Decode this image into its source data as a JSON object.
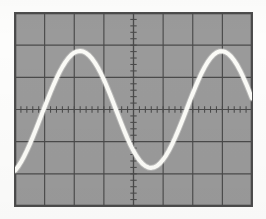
{
  "figure": {
    "kind": "oscilloscope-screen",
    "caption": "",
    "page_background": "#fdfdfc"
  },
  "screen": {
    "label": "CRT display",
    "background_color": "#9a9a9a",
    "border_color": "#4d4d4d",
    "graticule_color": "#4a4a4a",
    "trace_color": "#fbfbf7",
    "left": 14,
    "top": 12,
    "width": 239,
    "height": 195
  },
  "graticule": {
    "label": "graticule",
    "horizontal_divisions": 8,
    "vertical_divisions": 6,
    "division_width_px": 29.6,
    "division_height_px": 32.2,
    "minor_ticks_per_division": 5,
    "center_x_px": 133.5,
    "center_y_px": 109.5,
    "has_center_axis_ticks": true
  },
  "chart_data": {
    "type": "line",
    "title": "",
    "subtitle": "",
    "xlabel": "",
    "ylabel": "",
    "legend": [],
    "grid": true,
    "waveform": "sine",
    "amplitude_divisions": 2.0,
    "period_divisions": 4.0,
    "cycles_visible": 2.0,
    "phase_at_left_edge_deg": 200,
    "vertical_offset_divisions": 0,
    "xlim_divisions": [
      -4,
      4
    ],
    "ylim_divisions": [
      -3,
      3
    ],
    "peaks_divisions_x": [
      -2.4,
      1.6
    ],
    "troughs_divisions_x": [
      -0.4,
      3.6
    ],
    "x": [
      -4.0,
      -3.9,
      -3.8,
      -3.7,
      -3.6,
      -3.5,
      -3.4,
      -3.3,
      -3.2,
      -3.1,
      -3.0,
      -2.9,
      -2.8,
      -2.7,
      -2.6,
      -2.5,
      -2.4,
      -2.3,
      -2.2,
      -2.1,
      -2.0,
      -1.9,
      -1.8,
      -1.7,
      -1.6,
      -1.5,
      -1.4,
      -1.3,
      -1.2,
      -1.1,
      -1.0,
      -0.9,
      -0.8,
      -0.7,
      -0.6,
      -0.5,
      -0.4,
      -0.3,
      -0.2,
      -0.1,
      0.0,
      0.1,
      0.2,
      0.3,
      0.4,
      0.5,
      0.6,
      0.7,
      0.8,
      0.9,
      1.0,
      1.1,
      1.2,
      1.3,
      1.4,
      1.5,
      1.6,
      1.7,
      1.8,
      1.9,
      2.0,
      2.1,
      2.2,
      2.3,
      2.4,
      2.5,
      2.6,
      2.7,
      2.8,
      2.9,
      3.0,
      3.1,
      3.2,
      3.3,
      3.4,
      3.5,
      3.6,
      3.7,
      3.8,
      3.9,
      4.0
    ],
    "y": [
      -1.902,
      -1.782,
      -1.637,
      -1.469,
      -1.281,
      -1.076,
      -0.858,
      -0.63,
      -0.396,
      -0.159,
      0.079,
      0.313,
      0.541,
      0.76,
      0.966,
      1.155,
      1.325,
      1.473,
      1.597,
      1.695,
      1.765,
      1.806,
      1.819,
      1.802,
      1.756,
      1.681,
      1.579,
      1.45,
      1.297,
      1.122,
      0.927,
      0.716,
      0.492,
      0.258,
      0.019,
      -0.222,
      -0.459,
      -0.688,
      -0.905,
      -1.106,
      -1.287,
      -1.445,
      -1.577,
      -1.682,
      -1.757,
      -1.801,
      -1.814,
      -1.796,
      -1.747,
      -1.668,
      -1.56,
      -1.425,
      -1.266,
      -1.085,
      -0.886,
      -0.672,
      -0.447,
      -0.214,
      0.023,
      0.261,
      0.495,
      0.722,
      0.937,
      1.136,
      1.315,
      1.47,
      1.599,
      1.699,
      1.769,
      1.807,
      1.813,
      1.787,
      1.729,
      1.64,
      1.522,
      1.377,
      1.207,
      1.015,
      0.806,
      0.582,
      0.348
    ]
  },
  "a11y": {
    "description": "Oscilloscope display showing a sine wave of about two divisions amplitude and four divisions period on an eight by six division graticule."
  }
}
